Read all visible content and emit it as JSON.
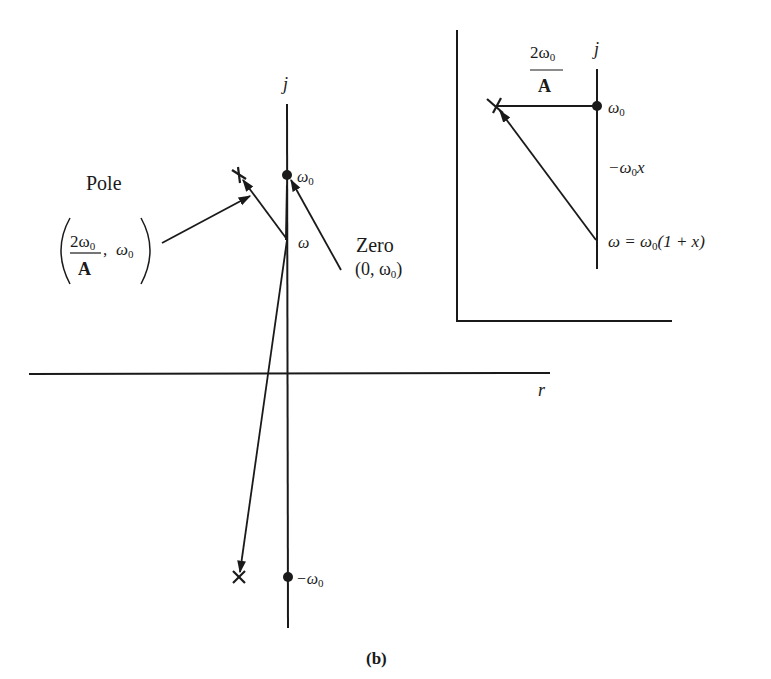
{
  "main_diagram": {
    "vertical_axis_label": "j",
    "horizontal_axis_label": "r",
    "zero_upper_label": "ω",
    "zero_upper_sub": "0",
    "zero_lower_label": "−ω",
    "zero_lower_sub": "0",
    "omega_point_label": "ω",
    "pole_label": "Pole",
    "pole_coord_numerator": "2ω",
    "pole_coord_numerator_sub": "0",
    "pole_coord_denominator": "A",
    "pole_coord_second": "ω",
    "pole_coord_second_sub": "0",
    "zero_label": "Zero",
    "zero_coord_prefix": "(0, ω",
    "zero_coord_sub": "0",
    "zero_coord_suffix": ")"
  },
  "inset_diagram": {
    "vertical_axis_label": "j",
    "distance_numerator": "2ω",
    "distance_numerator_sub": "0",
    "distance_denominator": "A",
    "zero_label": "ω",
    "zero_sub": "0",
    "offset_label_prefix": "−ω",
    "offset_label_sub": "0",
    "offset_label_suffix": "x",
    "omega_eq_prefix": "ω = ω",
    "omega_eq_sub": "0",
    "omega_eq_suffix": "(1 + x)"
  },
  "caption": "(b)",
  "colors": {
    "ink": "#1a1a1a",
    "background": "#ffffff"
  }
}
